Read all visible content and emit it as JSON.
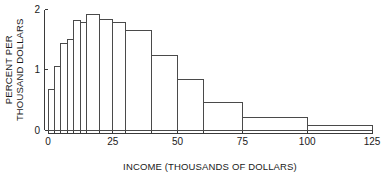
{
  "chart_data": {
    "type": "bar",
    "title": "",
    "subtitle": "",
    "xlabel": "INCOME (THOUSANDS OF DOLLARS)",
    "ylabel_line1": "PERCENT PER",
    "ylabel_line2": "THOUSAND DOLLARS",
    "ylabel": "PERCENT PER THOUSAND DOLLARS",
    "xlim": [
      0,
      125
    ],
    "ylim": [
      0,
      2
    ],
    "grid": false,
    "legend": false,
    "legend_position": "none",
    "xticks": [
      0,
      25,
      50,
      75,
      100,
      125
    ],
    "xtick_labels": [
      "0",
      "25",
      "50",
      "75",
      "100",
      "125"
    ],
    "yticks": [
      0,
      1,
      2
    ],
    "ytick_labels": [
      "0",
      "1",
      "2"
    ],
    "bin_edges": [
      0,
      2.5,
      5,
      7.5,
      10,
      12.5,
      15,
      20,
      25,
      30,
      40,
      50,
      60,
      75,
      100,
      125
    ],
    "values": [
      0.67,
      1.05,
      1.43,
      1.5,
      1.82,
      1.79,
      1.91,
      1.84,
      1.79,
      1.65,
      1.23,
      0.83,
      0.45,
      0.2,
      0.08
    ],
    "categories": [
      "0-2.5",
      "2.5-5",
      "5-7.5",
      "7.5-10",
      "10-12.5",
      "12.5-15",
      "15-20",
      "20-25",
      "25-30",
      "30-40",
      "40-50",
      "50-60",
      "60-75",
      "75-100",
      "100-125"
    ],
    "bar_color": "#ffffff",
    "bar_edge_color": "#4a4a4a",
    "axis_color": "#3a3a3a"
  }
}
